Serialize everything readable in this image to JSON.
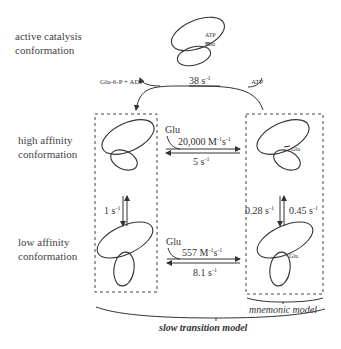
{
  "row_labels": {
    "active": [
      "active catalysis",
      "conformation"
    ],
    "high": [
      "high affinity",
      "conformation"
    ],
    "low": [
      "low affinity",
      "conformation"
    ]
  },
  "active_state": {
    "atp_label": "ATP",
    "glu_label": "Glu"
  },
  "catalysis": {
    "products_label": "Glu-6-P  + ADP",
    "rate": "38 s",
    "rate_exp": "-1",
    "substrate_label": "ATP"
  },
  "high_affinity": {
    "ligand_label": "Glu",
    "forward_rate": "20,000 M",
    "forward_rate_exp1": "-1",
    "forward_rate_unit": "s",
    "forward_rate_exp2": "-1",
    "reverse_rate": "5 s",
    "reverse_rate_exp": "-1",
    "bound_glu_label": "Glu"
  },
  "transitions": {
    "left_rate": "1 s",
    "left_rate_exp": "-1",
    "right_down_rate": "0.28 s",
    "right_down_rate_exp": "-1",
    "right_up_rate": "0.45 s",
    "right_up_rate_exp": "-1"
  },
  "low_affinity": {
    "ligand_label": "Glu",
    "forward_rate": "557 M",
    "forward_rate_exp1": "-1",
    "forward_rate_unit": "s",
    "forward_rate_exp2": "-1",
    "reverse_rate": "8.1 s",
    "reverse_rate_exp": "-1",
    "bound_glu_label": "Glu"
  },
  "models": {
    "mnemonic": "mnemonic model",
    "slow_transition": "slow transition model"
  },
  "colors": {
    "stroke": "#333333",
    "text": "#333333",
    "background": "#ffffff"
  }
}
